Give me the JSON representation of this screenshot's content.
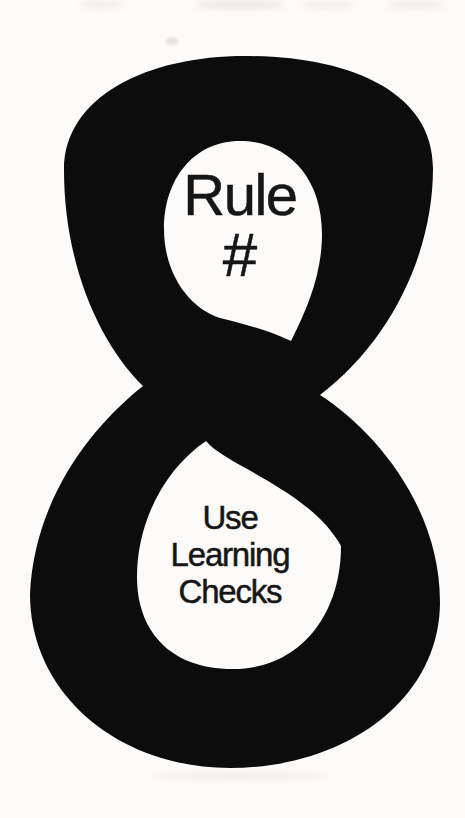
{
  "figure": {
    "numeral": "8",
    "top_label": {
      "word": "Rule",
      "symbol": "#"
    },
    "bottom_label": {
      "line1": "Use",
      "line2": "Learning",
      "line3": "Checks"
    },
    "colors": {
      "numeral": "#0c0c0c",
      "text": "#161616",
      "background": "#fcfbf9"
    }
  }
}
